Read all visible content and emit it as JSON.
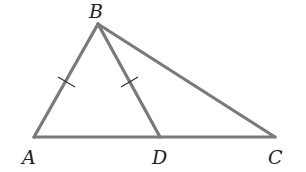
{
  "diagram": {
    "type": "triangle",
    "line_color": "#7a7a7a",
    "tick_color": "#333333",
    "points": {
      "A": {
        "label": "A",
        "x": 34,
        "y": 137,
        "lx": 24,
        "ly": 164
      },
      "B": {
        "label": "B",
        "x": 98,
        "y": 24,
        "lx": 89,
        "ly": 18
      },
      "C": {
        "label": "C",
        "x": 275,
        "y": 137,
        "lx": 268,
        "ly": 164
      },
      "D": {
        "label": "D",
        "x": 160,
        "y": 137,
        "lx": 153,
        "ly": 164
      }
    },
    "segments": [
      {
        "from": "A",
        "to": "B",
        "tick": true
      },
      {
        "from": "B",
        "to": "D",
        "tick": true
      },
      {
        "from": "B",
        "to": "C",
        "tick": false
      },
      {
        "from": "A",
        "to": "C",
        "tick": false
      }
    ],
    "annotation": "AB = BD (congruent tick marks)"
  }
}
